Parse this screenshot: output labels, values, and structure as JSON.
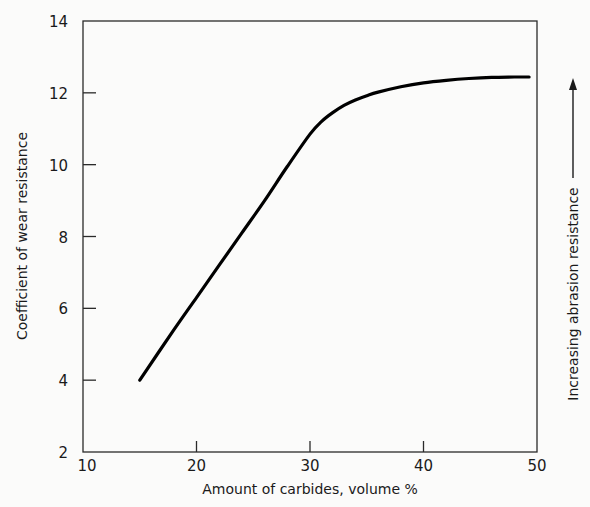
{
  "chart_data": {
    "type": "line",
    "title": "",
    "xlabel": "Amount of carbides, volume %",
    "ylabel": "Coefficient of wear resistance",
    "right_annotation": "Increasing abrasion resistance",
    "xlim": [
      10,
      50
    ],
    "ylim": [
      2,
      14
    ],
    "xticks": [
      10,
      20,
      30,
      40,
      50
    ],
    "yticks": [
      2,
      4,
      6,
      8,
      10,
      12,
      14
    ],
    "grid": false,
    "legend": null,
    "series": [
      {
        "name": "Coefficient of wear resistance",
        "x": [
          15,
          18,
          20,
          22,
          24,
          26,
          28,
          30,
          31,
          32,
          33,
          34,
          35,
          36,
          38,
          40,
          42,
          44,
          46,
          48,
          49.3
        ],
        "y": [
          4.0,
          5.4,
          6.3,
          7.2,
          8.1,
          9.0,
          9.95,
          10.85,
          11.2,
          11.45,
          11.65,
          11.8,
          11.92,
          12.02,
          12.17,
          12.28,
          12.35,
          12.4,
          12.43,
          12.44,
          12.44
        ]
      }
    ]
  },
  "axes": {
    "x_tick_labels": [
      "10",
      "20",
      "30",
      "40",
      "50"
    ],
    "y_tick_labels": [
      "2",
      "4",
      "6",
      "8",
      "10",
      "12",
      "14"
    ]
  },
  "colors": {
    "line": "#000000",
    "axis": "#2a2a2a",
    "background": "#fbfbfa"
  }
}
